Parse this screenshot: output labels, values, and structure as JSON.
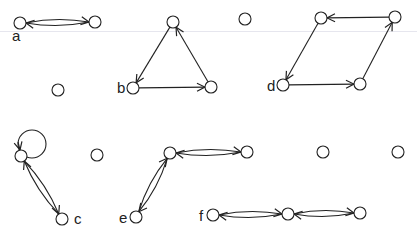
{
  "figure": {
    "graphs": [
      {
        "id": "a",
        "label": "a",
        "label_pos": [
          12,
          41
        ],
        "nodes": [
          [
            20,
            23
          ],
          [
            95,
            22
          ]
        ],
        "edges": [
          {
            "from": 1,
            "to": 0,
            "curve": -6
          },
          {
            "from": 0,
            "to": 1,
            "curve": -6
          }
        ]
      },
      {
        "id": "b",
        "label": "b",
        "label_pos": [
          117,
          93
        ],
        "nodes": [
          [
            173,
            22
          ],
          [
            133,
            88
          ],
          [
            211,
            87
          ]
        ],
        "edges": [
          {
            "from": 0,
            "to": 1,
            "curve": 0
          },
          {
            "from": 1,
            "to": 2,
            "curve": 0
          },
          {
            "from": 2,
            "to": 0,
            "curve": 0
          }
        ]
      },
      {
        "id": "d",
        "label": "d",
        "label_pos": [
          267,
          91
        ],
        "nodes": [
          [
            321,
            18
          ],
          [
            395,
            17
          ],
          [
            283,
            85
          ],
          [
            360,
            84
          ]
        ],
        "edges": [
          {
            "from": 1,
            "to": 0,
            "curve": 0
          },
          {
            "from": 0,
            "to": 2,
            "curve": 0
          },
          {
            "from": 2,
            "to": 3,
            "curve": 0
          },
          {
            "from": 3,
            "to": 1,
            "curve": 0
          }
        ]
      },
      {
        "id": "c",
        "label": "c",
        "label_pos": [
          74,
          224
        ],
        "nodes": [
          [
            21,
            156
          ],
          [
            62,
            219
          ]
        ],
        "loops": [
          {
            "node": 0,
            "cx": 32,
            "cy": 144,
            "r": 14
          }
        ],
        "edges": [
          {
            "from": 0,
            "to": 1,
            "curve": -6
          },
          {
            "from": 1,
            "to": 0,
            "curve": -6
          }
        ]
      },
      {
        "id": "e",
        "label": "e",
        "label_pos": [
          119,
          223
        ],
        "nodes": [
          [
            170,
            153
          ],
          [
            247,
            152
          ],
          [
            136,
            217
          ]
        ],
        "edges": [
          {
            "from": 1,
            "to": 0,
            "curve": -6
          },
          {
            "from": 0,
            "to": 1,
            "curve": -6
          },
          {
            "from": 0,
            "to": 2,
            "curve": -6
          },
          {
            "from": 2,
            "to": 0,
            "curve": -6
          }
        ]
      },
      {
        "id": "f",
        "label": "f",
        "label_pos": [
          199,
          221
        ],
        "nodes": [
          [
            213,
            215
          ],
          [
            288,
            214
          ],
          [
            360,
            213
          ]
        ],
        "edges": [
          {
            "from": 1,
            "to": 0,
            "curve": -6
          },
          {
            "from": 0,
            "to": 1,
            "curve": -6
          },
          {
            "from": 2,
            "to": 1,
            "curve": -6
          },
          {
            "from": 1,
            "to": 2,
            "curve": -6
          }
        ]
      }
    ],
    "isolated_nodes": [
      [
        58,
        90
      ],
      [
        245,
        19
      ],
      [
        97,
        155
      ],
      [
        323,
        152
      ],
      [
        398,
        152
      ]
    ],
    "node_radius": 6,
    "stroke_color": "#222222"
  }
}
